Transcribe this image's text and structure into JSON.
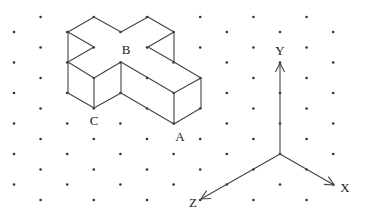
{
  "diagram": {
    "type": "isometric-dot-grid",
    "grid": {
      "x0": 14,
      "dx": 26.6,
      "columns": 13,
      "even_y0": 32,
      "odd_y0": 17,
      "dy": 30.5,
      "even_rows": 6,
      "odd_rows": 7,
      "dot_color": "#333333"
    },
    "shape": {
      "name": "cross-shaped prism",
      "edges": [
        [
          [
            68,
            32
          ],
          [
            94,
            17
          ]
        ],
        [
          [
            94,
            17
          ],
          [
            121,
            32
          ]
        ],
        [
          [
            121,
            32
          ],
          [
            148,
            17
          ]
        ],
        [
          [
            148,
            17
          ],
          [
            174,
            32
          ]
        ],
        [
          [
            68,
            32
          ],
          [
            94,
            47
          ]
        ],
        [
          [
            94,
            47
          ],
          [
            68,
            62
          ]
        ],
        [
          [
            174,
            32
          ],
          [
            148,
            47
          ]
        ],
        [
          [
            148,
            47
          ],
          [
            174,
            62
          ]
        ],
        [
          [
            174,
            32
          ],
          [
            174,
            62
          ]
        ],
        [
          [
            68,
            32
          ],
          [
            68,
            93
          ]
        ],
        [
          [
            68,
            62
          ],
          [
            94,
            78
          ]
        ],
        [
          [
            94,
            78
          ],
          [
            121,
            62
          ]
        ],
        [
          [
            121,
            62
          ],
          [
            174,
            93
          ]
        ],
        [
          [
            174,
            62
          ],
          [
            201,
            78
          ]
        ],
        [
          [
            201,
            78
          ],
          [
            174,
            93
          ]
        ],
        [
          [
            94,
            78
          ],
          [
            94,
            108
          ]
        ],
        [
          [
            121,
            62
          ],
          [
            121,
            93
          ]
        ],
        [
          [
            174,
            93
          ],
          [
            174,
            124
          ]
        ],
        [
          [
            201,
            78
          ],
          [
            201,
            108
          ]
        ],
        [
          [
            68,
            93
          ],
          [
            94,
            108
          ]
        ],
        [
          [
            94,
            108
          ],
          [
            121,
            93
          ]
        ],
        [
          [
            121,
            93
          ],
          [
            174,
            124
          ]
        ],
        [
          [
            174,
            124
          ],
          [
            201,
            108
          ]
        ]
      ],
      "vertices": [
        [
          68,
          32
        ],
        [
          94,
          17
        ],
        [
          121,
          32
        ],
        [
          148,
          17
        ],
        [
          174,
          32
        ],
        [
          94,
          47
        ],
        [
          148,
          47
        ],
        [
          68,
          62
        ],
        [
          174,
          62
        ],
        [
          121,
          62
        ],
        [
          94,
          78
        ],
        [
          201,
          78
        ],
        [
          148,
          78
        ],
        [
          68,
          93
        ],
        [
          121,
          93
        ],
        [
          174,
          93
        ],
        [
          94,
          108
        ],
        [
          201,
          108
        ],
        [
          148,
          108
        ],
        [
          174,
          124
        ]
      ],
      "labels": [
        {
          "id": "label-b",
          "text": "B",
          "x": 126,
          "y": 54
        },
        {
          "id": "label-c",
          "text": "C",
          "x": 94,
          "y": 125
        },
        {
          "id": "label-a",
          "text": "A",
          "x": 180,
          "y": 141
        }
      ]
    },
    "axes": {
      "origin": [
        280,
        154
      ],
      "y_axis": {
        "label": "Y",
        "tip": [
          280,
          63
        ],
        "label_pos": [
          280,
          55
        ]
      },
      "x_axis": {
        "label": "X",
        "tip": [
          334,
          185
        ],
        "label_pos": [
          345,
          192
        ]
      },
      "z_axis": {
        "label": "Z",
        "tip": [
          201,
          199
        ],
        "label_pos": [
          193,
          207
        ]
      }
    }
  }
}
